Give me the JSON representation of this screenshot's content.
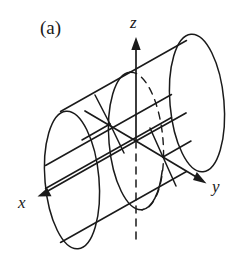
{
  "figure": {
    "panel_label": "(a)",
    "caption_text": "",
    "background_color": "#ffffff",
    "ink_color": "#1a1a1a",
    "width": 241,
    "height": 254
  },
  "axes": {
    "x": {
      "label": "x",
      "arrow_direction": "down-left",
      "tip": [
        38,
        196
      ],
      "origin": [
        136,
        141
      ]
    },
    "y": {
      "label": "y",
      "arrow_direction": "down-right",
      "tip": [
        207,
        183
      ],
      "origin": [
        136,
        141
      ]
    },
    "z": {
      "label": "z",
      "arrow_direction": "up",
      "tip": [
        136,
        38
      ],
      "origin": [
        136,
        141
      ],
      "hidden_segment": "below origin drawn dashed"
    }
  },
  "cylinder": {
    "axis_direction": "diagonal from lower-left to upper-right",
    "cross_sections": [
      {
        "name": "left-end-cap",
        "center": [
          72,
          180
        ],
        "rx": 27,
        "ry": 69,
        "style": "solid"
      },
      {
        "name": "middle-cross-section",
        "center": [
          136,
          141
        ],
        "rx": 27,
        "ry": 69,
        "style": "solid-with-hidden-dashes"
      },
      {
        "name": "right-end-cap",
        "center": [
          197,
          103
        ],
        "rx": 27,
        "ry": 69,
        "style": "solid"
      }
    ],
    "generator_lines": [
      {
        "name": "upper-generator",
        "from": [
          61,
          111
        ],
        "to": [
          186,
          41
        ]
      },
      {
        "name": "lower-generator",
        "from": [
          61,
          242
        ],
        "to": [
          186,
          172
        ]
      },
      {
        "name": "interior-generator-upper",
        "from": [
          46,
          165
        ],
        "to": [
          171,
          95
        ]
      },
      {
        "name": "interior-generator-lower",
        "from": [
          46,
          188
        ],
        "to": [
          171,
          118
        ]
      }
    ]
  },
  "intersections": [
    {
      "name": "upper-left-node",
      "point": [
        110,
        124
      ]
    },
    {
      "name": "origin-node",
      "point": [
        136,
        141
      ]
    },
    {
      "name": "lower-right-node",
      "point": [
        163,
        157
      ]
    }
  ],
  "labels": {
    "panel": "(a)",
    "x_axis": "x",
    "y_axis": "y",
    "z_axis": "z"
  }
}
